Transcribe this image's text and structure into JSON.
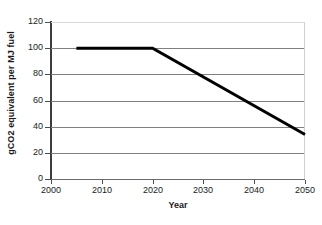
{
  "chart_data": {
    "type": "line",
    "title": "",
    "xlabel": "Year",
    "ylabel": "gCO2 equivalent per MJ fuel",
    "xlim": [
      2000,
      2050
    ],
    "ylim": [
      0,
      120
    ],
    "xticks": [
      2000,
      2010,
      2020,
      2030,
      2040,
      2050
    ],
    "yticks": [
      0,
      20,
      40,
      60,
      80,
      100,
      120
    ],
    "grid": "horizontal",
    "legend": "none",
    "series": [
      {
        "name": "gCO2 equivalent per MJ fuel",
        "color": "#000000",
        "line_width": 3,
        "x": [
          2005,
          2020,
          2050
        ],
        "values": [
          100,
          100,
          34
        ],
        "points": [
          {
            "x": 2005,
            "y": 100
          },
          {
            "x": 2020,
            "y": 100
          },
          {
            "x": 2030,
            "y": 78
          },
          {
            "x": 2040,
            "y": 56
          },
          {
            "x": 2050,
            "y": 34
          }
        ]
      }
    ]
  },
  "axes": {
    "y": {
      "title": "gCO2 equivalent per MJ fuel",
      "labels": [
        "120",
        "100",
        "80",
        "60",
        "40",
        "20",
        "0"
      ]
    },
    "x": {
      "title": "Year",
      "labels": [
        "2000",
        "2010",
        "2020",
        "2030",
        "2040",
        "2050"
      ]
    }
  }
}
